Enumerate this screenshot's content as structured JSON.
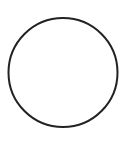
{
  "shape": {
    "type": "circle",
    "cx": 63,
    "cy": 72.5,
    "r": 54.5,
    "stroke": "#222222",
    "stroke_width": 2,
    "fill": "none"
  },
  "background": "#ffffff"
}
